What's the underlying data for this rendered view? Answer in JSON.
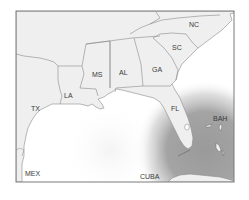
{
  "map": {
    "title": "Southeastern United States and Gulf of Mexico",
    "colors": {
      "land": "#efefef",
      "water": "#ffffff",
      "border": "#8a8a8a",
      "frame": "#7a7a7a",
      "shaded_region": "#9e9e9e",
      "label": "#3a3a3a"
    },
    "labels": [
      {
        "id": "nc",
        "text": "NC",
        "x": 189,
        "y": 27
      },
      {
        "id": "sc",
        "text": "SC",
        "x": 172,
        "y": 50
      },
      {
        "id": "ga",
        "text": "GA",
        "x": 152,
        "y": 72
      },
      {
        "id": "al",
        "text": "AL",
        "x": 119,
        "y": 75
      },
      {
        "id": "ms",
        "text": "MS",
        "x": 92,
        "y": 77
      },
      {
        "id": "la",
        "text": "LA",
        "x": 64,
        "y": 98
      },
      {
        "id": "tx",
        "text": "TX",
        "x": 31,
        "y": 111
      },
      {
        "id": "fl",
        "text": "FL",
        "x": 171,
        "y": 111
      },
      {
        "id": "bah",
        "text": "BAH",
        "x": 213,
        "y": 121
      },
      {
        "id": "mex",
        "text": "MEX",
        "x": 25,
        "y": 176
      },
      {
        "id": "cuba",
        "text": "CUBA",
        "x": 140,
        "y": 179
      }
    ]
  }
}
